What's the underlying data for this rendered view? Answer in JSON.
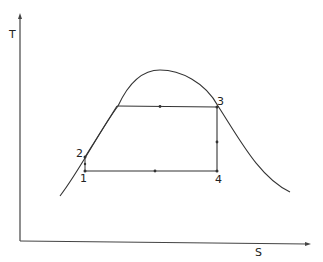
{
  "diagram": {
    "type": "T-S diagram (thermodynamic cycle)",
    "axes": {
      "y_label": "T",
      "x_label": "S"
    },
    "points": [
      {
        "id": "1",
        "label": "1"
      },
      {
        "id": "2",
        "label": "2"
      },
      {
        "id": "3",
        "label": "3"
      },
      {
        "id": "4",
        "label": "4"
      }
    ],
    "colors": {
      "line": "#333333",
      "background": "#ffffff"
    }
  }
}
